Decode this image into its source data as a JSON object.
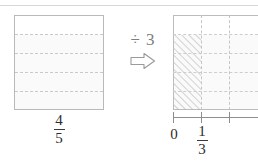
{
  "figure": {
    "kind": "fraction-division-diagram",
    "top_rule_color": "#d8d8d8"
  },
  "left_model": {
    "name": "whole-divided-into-fifths",
    "rows": 5,
    "shaded_rows": 4,
    "fraction": {
      "numerator": "4",
      "denominator": "5"
    },
    "box_color": "#b9b9b9",
    "dash_color": "#c9c9c9",
    "shade_color": "#fafafa"
  },
  "operator": {
    "divide_text": "÷ 3",
    "arrow_icon": "right-arrow-outline-icon",
    "color": "#8a8a8a"
  },
  "right_model": {
    "name": "fifths-split-into-thirds",
    "rows": 5,
    "columns": 3,
    "shaded_rows": 4,
    "hatched_columns": 1,
    "box_color": "#bcbcbc",
    "dash_color": "#cdcdcd",
    "hatch_color": "#b0b0b0",
    "shade_color": "#fafafa"
  },
  "number_line": {
    "axis_color": "#8e8e8e",
    "ticks": [
      {
        "label": "0",
        "position_px": 0
      },
      {
        "label_fraction": {
          "numerator": "1",
          "denominator": "3"
        },
        "position_px": 28
      },
      {
        "label": "",
        "position_px": 56
      }
    ],
    "zero_label": "0",
    "third_fraction": {
      "numerator": "1",
      "denominator": "3"
    }
  }
}
